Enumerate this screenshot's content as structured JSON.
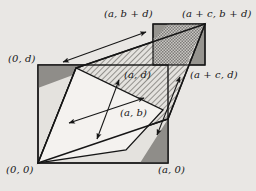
{
  "figure": {
    "type": "geometric-diagram",
    "background_color": "#e9e7e4",
    "stroke_color": "#161616",
    "fill_white": "#f4f2ef",
    "fill_hatch_light": "#cfcdc9",
    "fill_dark_gray": "#8c8a87",
    "fill_checker": "#a9a7a3",
    "labels": [
      {
        "id": "label-a-b-plus-d",
        "text": "(a, b + d)",
        "x": 104,
        "y": 9
      },
      {
        "id": "label-a-plus-c-b-plus-d",
        "text": "(a + c, b + d)",
        "x": 182,
        "y": 9
      },
      {
        "id": "label-0-d",
        "text": "(0, d)",
        "x": 8,
        "y": 54
      },
      {
        "id": "label-a-d",
        "text": "(a, d)",
        "x": 124,
        "y": 70
      },
      {
        "id": "label-a-plus-c-d",
        "text": "(a + c, d)",
        "x": 190,
        "y": 70
      },
      {
        "id": "label-a-b",
        "text": "(a, b)",
        "x": 120,
        "y": 108
      },
      {
        "id": "label-0-0",
        "text": "(0, 0)",
        "x": 6,
        "y": 165
      },
      {
        "id": "label-a-0",
        "text": "(a, 0)",
        "x": 158,
        "y": 165
      }
    ],
    "geometry": {
      "main_rect": {
        "x1": 38,
        "y1": 65,
        "x2": 168,
        "y2": 163
      },
      "upper_rect": {
        "x1": 153,
        "y1": 24,
        "x2": 205,
        "y2": 65
      },
      "parallelogram_white": [
        {
          "x": 38,
          "y": 163
        },
        {
          "x": 76,
          "y": 68
        },
        {
          "x": 163,
          "y": 110
        },
        {
          "x": 126,
          "y": 150
        }
      ],
      "big_parallelogram": [
        {
          "x": 38,
          "y": 163
        },
        {
          "x": 76,
          "y": 68
        },
        {
          "x": 205,
          "y": 24
        },
        {
          "x": 168,
          "y": 119
        }
      ]
    },
    "arrows": [
      {
        "id": "arrow-top-translation",
        "x1": 61,
        "y1": 63,
        "x2": 148,
        "y2": 31,
        "double": true
      },
      {
        "id": "arrow-interior-horizontal",
        "x1": 67,
        "y1": 124,
        "x2": 146,
        "y2": 97,
        "double": true
      },
      {
        "id": "arrow-interior-diagonal",
        "x1": 96,
        "y1": 141,
        "x2": 120,
        "y2": 78,
        "double": true
      },
      {
        "id": "arrow-right-lower",
        "x1": 158,
        "y1": 137,
        "x2": 182,
        "y2": 75,
        "double": true
      }
    ]
  }
}
